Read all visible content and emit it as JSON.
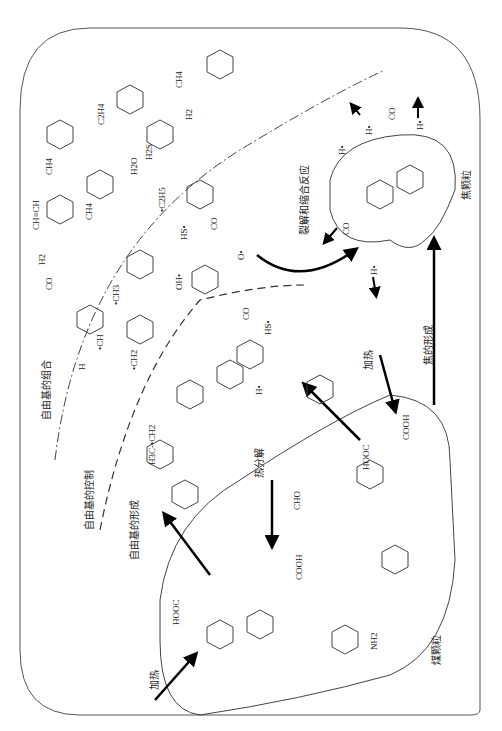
{
  "diagram": {
    "orientation": "rotated-90-ccw",
    "zones": {
      "coal_particle": {
        "label": "煤颗粒"
      },
      "char_particle": {
        "label": "焦颗粒"
      },
      "radical_combination_zone": {
        "label": "自由基的组合"
      },
      "radical_control_zone": {
        "label": "自由基的控制"
      },
      "radical_formation_zone": {
        "label": "自由基的形成"
      }
    },
    "process_labels": {
      "heating_1": "加热",
      "heating_2": "加热",
      "pyrolysis": "热分解",
      "char_formation": "焦的形成",
      "cracking_condensation": "裂解和缩合反应",
      "radical_formation": "自由基的形成",
      "radical_control": "自由基的控制",
      "radical_combination": "自由基的组合"
    },
    "outer_region_species": [
      "CH4",
      "C2H4",
      "H2",
      "H2S",
      "H2O",
      "CH4",
      "CH4",
      "H2",
      "CO",
      "OH",
      "OH",
      "CH≡CH"
    ],
    "middle_region_species": [
      "•C2H5",
      "HS•",
      "CO",
      "O•",
      "OH•",
      "•CH3",
      "•CH",
      "H",
      "•CH2",
      "•O"
    ],
    "inner_region_species": [
      "H•",
      "HS•",
      "CO",
      "•CH3",
      "CH3",
      "H3C-•CH2",
      "•CH2",
      "•O",
      "•CH2"
    ],
    "char_emissions": [
      "H•",
      "H•",
      "CO",
      "H•",
      "CO",
      "H•"
    ],
    "coal_groups": [
      "HOOC",
      "COOH",
      "HO",
      "OH",
      "O",
      "CHO",
      "HC-OH",
      "HO-CH",
      "HC-OH",
      "HC-OH",
      "C=O",
      "COOH",
      "N",
      "R",
      "NH",
      "NH2",
      "O"
    ]
  }
}
